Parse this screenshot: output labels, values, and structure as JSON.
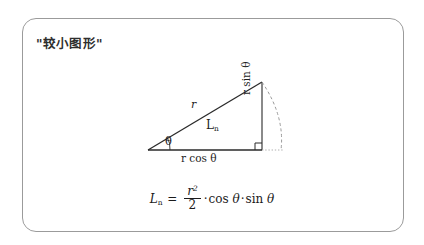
{
  "page": {
    "background_color": "#ffffff",
    "width": 424,
    "height": 245
  },
  "frame": {
    "border_color": "#9b9b9b",
    "corner_radius_px": 14
  },
  "title": "\"较小图形\"",
  "diagram": {
    "type": "right-triangle-trigonometry",
    "stroke_color": "#2a2a2a",
    "dashed_color": "#9a9a9a",
    "vertices": {
      "left": [
        148,
        150
      ],
      "apex": [
        262,
        82
      ],
      "right_angle": [
        262,
        150
      ]
    },
    "labels": {
      "hypotenuse": "r",
      "angle": "θ",
      "area": "L",
      "area_subscript": "n",
      "base": "r cos θ",
      "height": "r sin θ"
    },
    "markers": {
      "right_angle_square": true,
      "dashed_arc": true,
      "dotted_baseline_extension": true
    }
  },
  "formula": {
    "lhs": "L",
    "lhs_subscript": "n",
    "equals": "=",
    "numerator": "r",
    "numerator_exponent": "2",
    "denominator": "2",
    "dot1": "·",
    "cos": "cos",
    "theta1": "θ",
    "dot2": "·",
    "sin": "sin",
    "theta2": "θ"
  }
}
